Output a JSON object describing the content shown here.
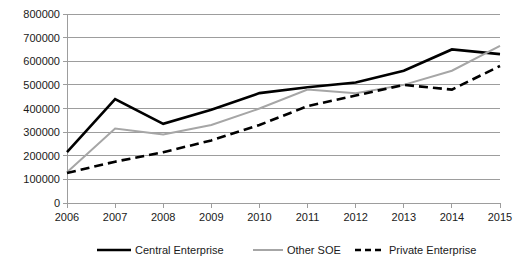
{
  "chart_data": {
    "type": "line",
    "title": "",
    "xlabel": "",
    "ylabel": "",
    "categories": [
      "2006",
      "2007",
      "2008",
      "2009",
      "2010",
      "2011",
      "2012",
      "2013",
      "2014",
      "2015"
    ],
    "x": [
      2006,
      2007,
      2008,
      2009,
      2010,
      2011,
      2012,
      2013,
      2014,
      2015
    ],
    "ylim": [
      0,
      800000
    ],
    "ytick_values": [
      0,
      100000,
      200000,
      300000,
      400000,
      500000,
      600000,
      700000,
      800000
    ],
    "ytick_labels": [
      "0",
      "100000",
      "200000",
      "300000",
      "400000",
      "500000",
      "600000",
      "700000",
      "800000"
    ],
    "grid": "horizontal",
    "legend_position": "bottom",
    "series": [
      {
        "name": "Central Enterprise",
        "color": "#000000",
        "style": "solid",
        "width": 2.6,
        "values": [
          215000,
          440000,
          335000,
          395000,
          465000,
          490000,
          510000,
          560000,
          650000,
          630000
        ]
      },
      {
        "name": "Other SOE",
        "color": "#a6a6a6",
        "style": "solid",
        "width": 2.0,
        "values": [
          130000,
          315000,
          290000,
          330000,
          400000,
          480000,
          465000,
          500000,
          560000,
          665000
        ]
      },
      {
        "name": "Private Enterprise",
        "color": "#000000",
        "style": "dashed",
        "width": 2.6,
        "values": [
          127000,
          175000,
          215000,
          265000,
          330000,
          410000,
          455000,
          500000,
          480000,
          580000
        ]
      }
    ]
  },
  "legend": {
    "items": [
      {
        "label": "Central Enterprise"
      },
      {
        "label": "Other SOE"
      },
      {
        "label": "Private Enterprise"
      }
    ]
  }
}
